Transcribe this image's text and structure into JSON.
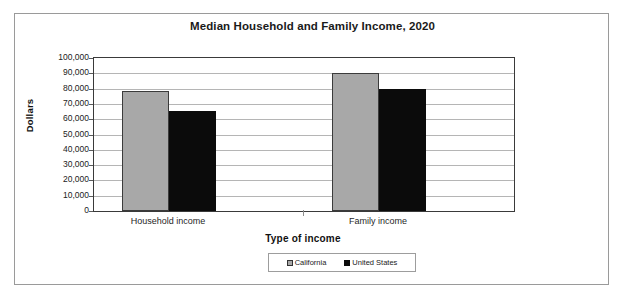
{
  "chart_data": {
    "type": "bar",
    "title": "Median Household and Family Income, 2020",
    "xlabel": "Type of income",
    "ylabel": "Dollars",
    "categories": [
      "Household income",
      "Family income"
    ],
    "series": [
      {
        "name": "California",
        "color": "#a8a8a8",
        "values": [
          78700,
          90200
        ]
      },
      {
        "name": "United States",
        "color": "#0b0b0b",
        "values": [
          65300,
          79900
        ]
      }
    ],
    "ylim": [
      0,
      100000
    ],
    "ytick_values": [
      0,
      10000,
      20000,
      30000,
      40000,
      50000,
      60000,
      70000,
      80000,
      90000,
      100000
    ],
    "ytick_labels": [
      "0",
      "10,000",
      "20,000",
      "30,000",
      "40,000",
      "50,000",
      "60,000",
      "70,000",
      "80,000",
      "90,000",
      "100,000"
    ],
    "grid": true,
    "legend_position": "bottom"
  },
  "legend": {
    "entries": [
      {
        "label": "California"
      },
      {
        "label": "United States"
      }
    ]
  }
}
